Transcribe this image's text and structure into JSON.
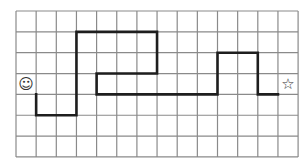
{
  "grid": {
    "cols": 14,
    "rows": 7,
    "origin_x": 16,
    "origin_y": 11,
    "cell_w": 20.15,
    "cell_h": 20.85,
    "line_color": "#8a8a8a",
    "line_width": 1.2
  },
  "path": {
    "color": "#1e1e1e",
    "width": 2.6,
    "points": [
      [
        1,
        4
      ],
      [
        1,
        5
      ],
      [
        3,
        5
      ],
      [
        3,
        1
      ],
      [
        7,
        1
      ],
      [
        7,
        3
      ],
      [
        4,
        3
      ],
      [
        4,
        4
      ],
      [
        10,
        4
      ],
      [
        10,
        2
      ],
      [
        12,
        2
      ],
      [
        12,
        4
      ],
      [
        13,
        4
      ]
    ]
  },
  "start": {
    "icon": "smiley-icon",
    "glyph": "☺",
    "cell": [
      0,
      3
    ]
  },
  "goal": {
    "icon": "star-icon",
    "glyph": "☆",
    "cell": [
      13,
      3
    ]
  }
}
